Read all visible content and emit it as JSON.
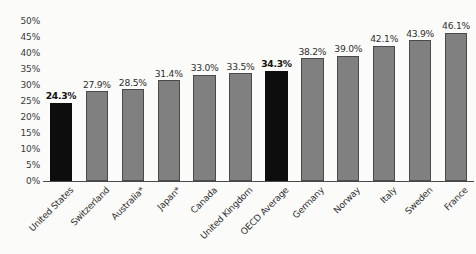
{
  "chart_data": {
    "type": "bar",
    "title": "",
    "subtitle": "",
    "xlabel": "",
    "ylabel": "",
    "ylim": [
      0,
      50
    ],
    "ytick_labels": [
      "50%",
      "45%",
      "40%",
      "35%",
      "30%",
      "25%",
      "20%",
      "15%",
      "10%",
      "5%",
      "0%"
    ],
    "ytick_values": [
      50,
      45,
      40,
      35,
      30,
      25,
      20,
      15,
      10,
      5,
      0
    ],
    "ytick_step": 5,
    "grid": false,
    "legend": null,
    "value_suffix": "%",
    "categories": [
      "United States",
      "Switzerland",
      "Australia*",
      "Japan*",
      "Canada",
      "United Kingdom",
      "OECD Average",
      "Germany",
      "Norway",
      "Italy",
      "Sweden",
      "France"
    ],
    "values": [
      24.3,
      27.9,
      28.5,
      31.4,
      33.0,
      33.5,
      34.3,
      38.2,
      39.0,
      42.1,
      43.9,
      46.1
    ],
    "data_labels": [
      "24.3%",
      "27.9%",
      "28.5%",
      "31.4%",
      "33.0%",
      "33.5%",
      "34.3%",
      "38.2%",
      "39.0%",
      "42.1%",
      "43.9%",
      "46.1%"
    ],
    "highlighted": [
      true,
      false,
      false,
      false,
      false,
      false,
      true,
      false,
      false,
      false,
      false,
      false
    ],
    "colors": {
      "bar": "#808080",
      "bar_highlight": "#0d0d0d",
      "bar_border": "#4a4a4a",
      "axis": "#4a4a4a",
      "text": "#2f2f2f",
      "background": "#fbfbf9"
    },
    "annotations": [
      "* denotes asterisked country labels: Australia*, Japan*"
    ]
  }
}
